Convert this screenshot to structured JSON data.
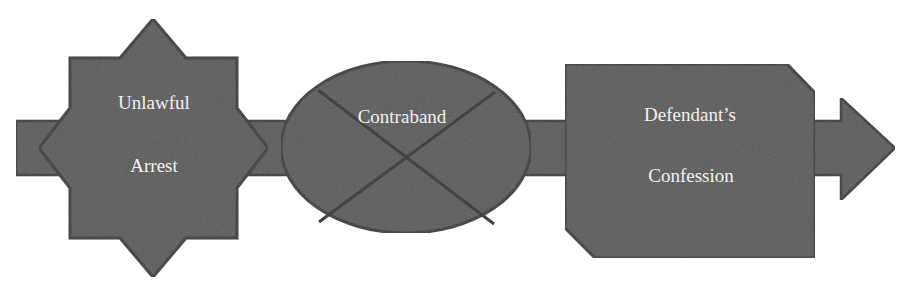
{
  "diagram": {
    "type": "flow-arrow",
    "direction": "left-to-right",
    "colors": {
      "fill": "#5c5c5c",
      "stroke": "#3a3a3a",
      "text": "#f2f2f2",
      "background": "#ffffff",
      "show_through_text": "#ececec"
    },
    "nodes": [
      {
        "id": "unlawful-arrest",
        "shape": "eight-point-star",
        "lines": [
          "Unlawful",
          "Arrest"
        ]
      },
      {
        "id": "contraband",
        "shape": "ellipse-crossed-out",
        "lines": [
          "Contraband"
        ]
      },
      {
        "id": "defendants-confession",
        "shape": "snipped-corner-rectangle",
        "lines": [
          "Defendant’s",
          "Confession"
        ]
      }
    ],
    "connector": "single block arrow running through all nodes, pointing right"
  }
}
